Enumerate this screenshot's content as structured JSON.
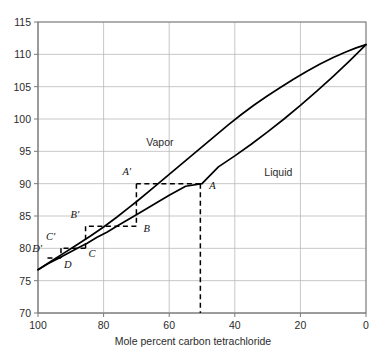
{
  "chart_data": {
    "type": "line",
    "title": "",
    "xlabel": "Mole percent carbon tetrachloride",
    "ylabel": "",
    "xlim": [
      100,
      0
    ],
    "ylim": [
      70,
      115
    ],
    "x_reversed": true,
    "grid": true,
    "legend_position": "inline-annotations",
    "xticks": [
      100,
      80,
      60,
      40,
      20,
      0
    ],
    "xtick_labels": [
      "100",
      "80",
      "60",
      "40",
      "20",
      "0"
    ],
    "yticks": [
      70,
      75,
      80,
      85,
      90,
      95,
      100,
      105,
      110,
      115
    ],
    "ytick_labels": [
      "70",
      "75",
      "80",
      "85",
      "90",
      "95",
      "100",
      "105",
      "110",
      "115"
    ],
    "series": [
      {
        "name": "Vapor",
        "label_x": 67,
        "label_y": 97.2,
        "points": [
          [
            100,
            76.7
          ],
          [
            96,
            78.0
          ],
          [
            92,
            79.3
          ],
          [
            88,
            80.6
          ],
          [
            84,
            81.9
          ],
          [
            80,
            83.3
          ],
          [
            76,
            84.8
          ],
          [
            72,
            86.4
          ],
          [
            70,
            87.2
          ],
          [
            66,
            88.9
          ],
          [
            62,
            90.6
          ],
          [
            58,
            92.3
          ],
          [
            54,
            94.0
          ],
          [
            50,
            95.7
          ],
          [
            46,
            97.4
          ],
          [
            42,
            99.1
          ],
          [
            38,
            100.7
          ],
          [
            34,
            102.2
          ],
          [
            30,
            103.6
          ],
          [
            26,
            104.9
          ],
          [
            22,
            106.2
          ],
          [
            18,
            107.4
          ],
          [
            14,
            108.5
          ],
          [
            10,
            109.5
          ],
          [
            6,
            110.4
          ],
          [
            3,
            111.0
          ],
          [
            0,
            111.5
          ]
        ]
      },
      {
        "name": "Liquid",
        "label_x": 31,
        "label_y": 92.6,
        "points": [
          [
            100,
            76.7
          ],
          [
            97,
            77.6
          ],
          [
            94,
            78.4
          ],
          [
            91,
            79.2
          ],
          [
            88,
            80.0
          ],
          [
            85,
            80.8
          ],
          [
            82,
            81.7
          ],
          [
            79,
            82.5
          ],
          [
            76,
            83.4
          ],
          [
            73,
            84.3
          ],
          [
            70,
            85.2
          ],
          [
            65,
            86.7
          ],
          [
            60,
            88.2
          ],
          [
            55,
            89.6
          ],
          [
            50,
            90.0
          ],
          [
            45,
            92.6
          ],
          [
            40,
            94.3
          ],
          [
            35,
            96.1
          ],
          [
            30,
            98.0
          ],
          [
            25,
            100.0
          ],
          [
            20,
            102.1
          ],
          [
            15,
            104.3
          ],
          [
            10,
            106.6
          ],
          [
            5,
            109.0
          ],
          [
            0,
            111.5
          ]
        ]
      }
    ],
    "construction_points": [
      {
        "id": "A",
        "label": "A",
        "x": 50.5,
        "y": 90.0,
        "label_dx": 9,
        "label_dy": 3
      },
      {
        "id": "Ap",
        "label": "A'",
        "x": 70.0,
        "y": 90.0,
        "label_dx": -14,
        "label_dy": -11
      },
      {
        "id": "B",
        "label": "B",
        "x": 70.0,
        "y": 83.4,
        "label_dx": 7,
        "label_dy": 4
      },
      {
        "id": "Bp",
        "label": "B'",
        "x": 85.5,
        "y": 83.4,
        "label_dx": -15,
        "label_dy": -10
      },
      {
        "id": "C",
        "label": "C",
        "x": 85.5,
        "y": 80.0,
        "label_dx": 3,
        "label_dy": 7
      },
      {
        "id": "Cp",
        "label": "C'",
        "x": 93.0,
        "y": 80.0,
        "label_dx": -15,
        "label_dy": -10
      },
      {
        "id": "D",
        "label": "D",
        "x": 93.0,
        "y": 78.5,
        "label_dx": 3,
        "label_dy": 8
      },
      {
        "id": "Dp",
        "label": "D'",
        "x": 97.2,
        "y": 78.5,
        "label_dx": -15,
        "label_dy": -8
      }
    ],
    "construction_segments": [
      {
        "from": [
          50.5,
          90.0
        ],
        "to": [
          70.0,
          90.0
        ],
        "kind": "horizontal-tie-line"
      },
      {
        "from": [
          50.5,
          90.0
        ],
        "to": [
          50.5,
          70.0
        ],
        "kind": "vertical-drop"
      },
      {
        "from": [
          70.0,
          90.0
        ],
        "to": [
          70.0,
          83.4
        ],
        "kind": "vertical-drop"
      },
      {
        "from": [
          70.0,
          83.4
        ],
        "to": [
          85.5,
          83.4
        ],
        "kind": "horizontal-tie-line"
      },
      {
        "from": [
          85.5,
          83.4
        ],
        "to": [
          85.5,
          80.0
        ],
        "kind": "vertical-drop"
      },
      {
        "from": [
          85.5,
          80.0
        ],
        "to": [
          93.0,
          80.0
        ],
        "kind": "horizontal-tie-line"
      },
      {
        "from": [
          93.0,
          80.0
        ],
        "to": [
          93.0,
          78.5
        ],
        "kind": "vertical-drop"
      },
      {
        "from": [
          93.0,
          78.5
        ],
        "to": [
          97.2,
          78.5
        ],
        "kind": "horizontal-tie-line"
      }
    ],
    "colors": {
      "curve": "#000000",
      "grid": "#b9b9b9",
      "axis": "#7a7a7a",
      "text": "#2b2b2b",
      "dashed": "#000000"
    }
  }
}
